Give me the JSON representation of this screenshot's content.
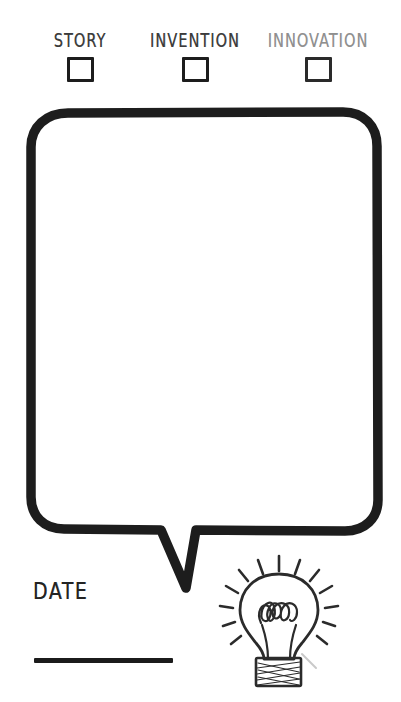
{
  "document": {
    "type": "worksheet",
    "title": "Idea capture worksheet",
    "background_color": "#ffffff",
    "ink_color": "#1d1d1d"
  },
  "categories": {
    "items": [
      {
        "label": "STORY",
        "checkbox_checked": false,
        "faded": false
      },
      {
        "label": "INVENTION",
        "checkbox_checked": false,
        "faded": false
      },
      {
        "label": "INNOVATION",
        "checkbox_checked": false,
        "faded": true
      }
    ]
  },
  "bubble": {
    "content": "",
    "placeholder": "",
    "border_color": "#1d1d1d",
    "fill_color": "#ffffff"
  },
  "date": {
    "label": "DATE",
    "value": "",
    "line_color": "#1b1b1b"
  },
  "lightbulb": {
    "icon": "lightbulb-icon",
    "ray_count": 12,
    "filament_loops": 4,
    "stroke_color": "#2b2b2b"
  }
}
